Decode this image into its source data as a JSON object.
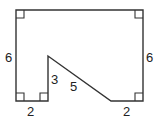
{
  "diagram": {
    "type": "polygon-with-labeled-sides",
    "stroke_color": "#333333",
    "vertices": [
      [
        16,
        10
      ],
      [
        143,
        10
      ],
      [
        143,
        101
      ],
      [
        111,
        101
      ],
      [
        48,
        56
      ],
      [
        48,
        101
      ],
      [
        16,
        101
      ]
    ],
    "right_angle_markers": [
      {
        "corner": "top-left",
        "x": 16,
        "y": 10,
        "dx": 1,
        "dy": 1
      },
      {
        "corner": "top-right",
        "x": 143,
        "y": 10,
        "dx": -1,
        "dy": 1
      },
      {
        "corner": "bottom-left",
        "x": 16,
        "y": 101,
        "dx": 1,
        "dy": -1
      },
      {
        "corner": "inner-bottom",
        "x": 48,
        "y": 101,
        "dx": -1,
        "dy": -1
      },
      {
        "corner": "bottom-right",
        "x": 143,
        "y": 101,
        "dx": -1,
        "dy": -1
      }
    ],
    "labels": {
      "left_side": "6",
      "right_side": "6",
      "bottom_left": "2",
      "inner_vertical": "3",
      "diagonal": "5",
      "bottom_right": "2"
    }
  }
}
